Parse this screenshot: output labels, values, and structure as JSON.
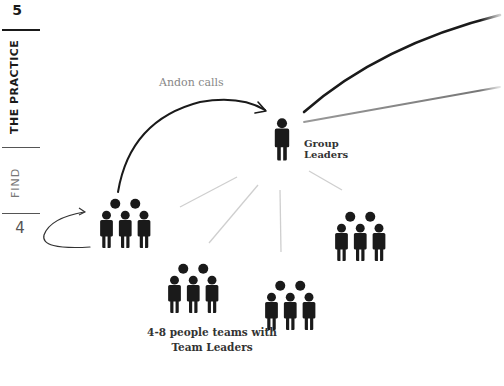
{
  "sidebar": {
    "chapter_number": "5",
    "chapter_title": "THE PRACTICE",
    "section_title": "FIND",
    "page_number": "4"
  },
  "diagram": {
    "andon_label": "Andon calls",
    "group_leaders_line1": "Group",
    "group_leaders_line2": "Leaders",
    "teams_label_line1": "4-8 people teams with",
    "teams_label_line2": "Team Leaders",
    "nodes": [
      {
        "id": "group-leader",
        "type": "single-person",
        "x": 282,
        "y": 140
      },
      {
        "id": "team-left",
        "type": "team",
        "x": 124,
        "y": 225
      },
      {
        "id": "team-bottom-left",
        "type": "team",
        "x": 192,
        "y": 290
      },
      {
        "id": "team-bottom-center",
        "type": "team",
        "x": 289,
        "y": 307
      },
      {
        "id": "team-right",
        "type": "team",
        "x": 359,
        "y": 238
      }
    ],
    "colors": {
      "icon": "#1a1a1a",
      "connector": "#c8c8c8",
      "label_muted": "#888888",
      "label_dark": "#333333"
    }
  }
}
